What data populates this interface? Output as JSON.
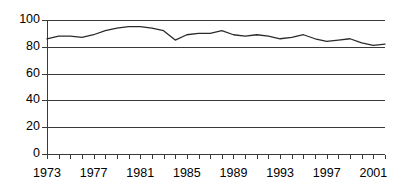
{
  "chart_data": {
    "type": "line",
    "title": "",
    "subtitle": "",
    "xlabel": "",
    "ylabel": "",
    "xlim": [
      1973,
      2002
    ],
    "ylim": [
      0,
      100
    ],
    "grid": true,
    "legend": null,
    "y_ticks": [
      0,
      20,
      40,
      60,
      80,
      100
    ],
    "y_tick_labels": [
      "0",
      "20",
      "40",
      "60",
      "80",
      "100"
    ],
    "x_tick_labels": [
      "1973",
      "1977",
      "1981",
      "1985",
      "1989",
      "1993",
      "1997",
      "2001"
    ],
    "x_tick_label_years": [
      1973,
      1977,
      1981,
      1985,
      1989,
      1993,
      1997,
      2001
    ],
    "x_minor_tick_years": [
      1973,
      1974,
      1975,
      1976,
      1977,
      1978,
      1979,
      1980,
      1981,
      1982,
      1983,
      1984,
      1985,
      1986,
      1987,
      1988,
      1989,
      1990,
      1991,
      1992,
      1993,
      1994,
      1995,
      1996,
      1997,
      1998,
      1999,
      2000,
      2001,
      2002
    ],
    "series": [
      {
        "name": "series-1",
        "color": "#2b2b2b",
        "x": [
          1973,
          1974,
          1975,
          1976,
          1977,
          1978,
          1979,
          1980,
          1981,
          1982,
          1983,
          1984,
          1985,
          1986,
          1987,
          1988,
          1989,
          1990,
          1991,
          1992,
          1993,
          1994,
          1995,
          1996,
          1997,
          1998,
          1999,
          2000,
          2001,
          2002
        ],
        "values": [
          86,
          88,
          88,
          87,
          89,
          92,
          94,
          95,
          95,
          94,
          92,
          85,
          89,
          90,
          90,
          92,
          89,
          88,
          89,
          88,
          86,
          87,
          89,
          86,
          84,
          85,
          86,
          83,
          81,
          82
        ]
      }
    ]
  },
  "axes": {
    "y_axis_name": "value-axis",
    "x_axis_name": "year-axis"
  }
}
